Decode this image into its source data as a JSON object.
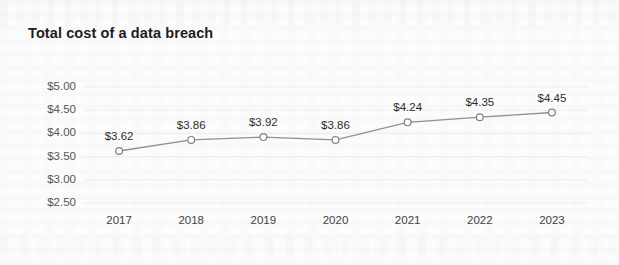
{
  "chart_data": {
    "type": "line",
    "title": "Total cost of a data breach",
    "xlabel": "",
    "ylabel": "",
    "categories": [
      "2017",
      "2018",
      "2019",
      "2020",
      "2021",
      "2022",
      "2023"
    ],
    "values": [
      3.62,
      3.86,
      3.92,
      3.86,
      4.24,
      4.35,
      4.45
    ],
    "point_labels": [
      "$3.62",
      "$3.86",
      "$3.92",
      "$3.86",
      "$4.24",
      "$4.35",
      "$4.45"
    ],
    "ytick_labels": [
      "$5.00",
      "$4.50",
      "$4.00",
      "$3.50",
      "$3.00",
      "$2.50"
    ],
    "ytick_values": [
      5.0,
      4.5,
      4.0,
      3.5,
      3.0,
      2.5
    ],
    "ylim": [
      2.5,
      5.0
    ],
    "grid": true,
    "legend": false,
    "series": [
      {
        "name": "Total cost of a data breach",
        "values": [
          3.62,
          3.86,
          3.92,
          3.86,
          4.24,
          4.35,
          4.45
        ]
      }
    ],
    "colors": {
      "line": "#8d9096",
      "marker_fill": "#ffffff",
      "marker_stroke": "#7e8187",
      "grid": "#ededed",
      "text": "#2b2d30",
      "axis_text": "#53565a",
      "background": "#fcfcfc"
    }
  }
}
